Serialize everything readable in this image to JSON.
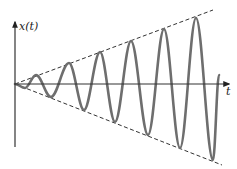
{
  "chart_data": {
    "type": "line",
    "title": "",
    "ylabel": "x(t)",
    "xlabel": "t",
    "grid": false,
    "legend": null,
    "origin_px": [
      15,
      84
    ],
    "peaks_px": [
      [
        36,
        75
      ],
      [
        69,
        63
      ],
      [
        100,
        52
      ],
      [
        131,
        41
      ],
      [
        164,
        29
      ],
      [
        196,
        18
      ]
    ],
    "troughs_px": [
      [
        25,
        88
      ],
      [
        51,
        97
      ],
      [
        84,
        110
      ],
      [
        115,
        122
      ],
      [
        148,
        135
      ],
      [
        180,
        148
      ],
      [
        213,
        160
      ]
    ],
    "end_px": [
      219,
      75
    ],
    "envelope_upper_px": [
      [
        15,
        84
      ],
      [
        213,
        10
      ]
    ],
    "envelope_lower_px": [
      [
        15,
        84
      ],
      [
        222,
        165
      ]
    ]
  },
  "labels": {
    "y_axis": "x(t)",
    "x_axis": "t"
  },
  "colors": {
    "axis": "#333333",
    "wave": "#6e6e6e",
    "envelope": "#333333"
  }
}
